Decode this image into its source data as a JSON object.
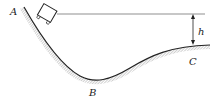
{
  "diagram": {
    "type": "physics-track",
    "labels": {
      "point_a": "A",
      "point_b": "B",
      "point_c": "C",
      "height": "h"
    },
    "colors": {
      "stroke": "#222222",
      "hatch": "#777777",
      "background": "#ffffff"
    }
  }
}
